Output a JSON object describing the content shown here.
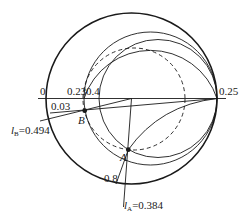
{
  "diagram": {
    "type": "smith-chart",
    "axis_labels": {
      "left": "0",
      "r023": "0.23",
      "r04": "0.4",
      "right": "0.25",
      "wavelength_b": "0.03",
      "r08": "0.8"
    },
    "points": {
      "A": {
        "label": "A"
      },
      "B": {
        "label": "B"
      }
    },
    "annotations": {
      "lb_symbol": "l",
      "lb_sub": "B",
      "lb_value": "=0.494",
      "la_symbol": "l",
      "la_sub": "A",
      "la_value": "=0.384"
    },
    "colors": {
      "stroke": "#1a1a1a",
      "background": "#ffffff"
    }
  }
}
